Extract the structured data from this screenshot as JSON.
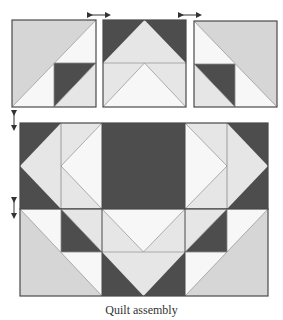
{
  "caption": "Quilt assembly",
  "colors": {
    "dark": "#4d4d4d",
    "light_gray": "#d6d6d6",
    "pale": "#e6e6e6",
    "white": "#f7f7f7",
    "border": "#4a4a4a",
    "seam": "#9a9a9a",
    "arrow": "#333333"
  },
  "top_row": {
    "blocks": [
      {
        "name": "left-block",
        "label": "Left block"
      },
      {
        "name": "center-block",
        "label": "Center block"
      },
      {
        "name": "right-block",
        "label": "Right block"
      }
    ],
    "arrows": [
      {
        "name": "horizontal-arrow-left",
        "direction": "horizontal"
      },
      {
        "name": "horizontal-arrow-right",
        "direction": "horizontal"
      }
    ]
  },
  "rows": [
    {
      "name": "middle-row",
      "label": "Middle row"
    },
    {
      "name": "bottom-row",
      "label": "Bottom row"
    }
  ],
  "vertical_arrows": [
    {
      "name": "vertical-arrow-top",
      "direction": "vertical"
    },
    {
      "name": "vertical-arrow-bottom",
      "direction": "vertical"
    }
  ]
}
